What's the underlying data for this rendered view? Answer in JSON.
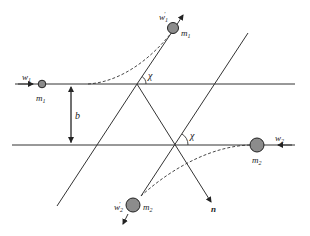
{
  "diagram": {
    "colors": {
      "line": "#333333",
      "ball_fill": "#8c8c8c",
      "ball_stroke": "#222222",
      "dashed": "#333333"
    },
    "labels": {
      "w1": "w",
      "w1_sub": "1",
      "m1_initial": "m",
      "m1_initial_sub": "1",
      "w1_prime": "w",
      "w1_prime_sub": "1",
      "w1_prime_mark": "'",
      "m1_final": "m",
      "m1_final_sub": "1",
      "b": "b",
      "chi_top": "χ",
      "chi_bottom": "χ",
      "w2": "w",
      "w2_sub": "2",
      "m2_initial": "m",
      "m2_initial_sub": "2",
      "w2_prime": "w",
      "w2_prime_sub": "2",
      "w2_prime_mark": "'",
      "m2_final": "m",
      "m2_final_sub": "2",
      "n": "n"
    },
    "elements": [
      "incoming particle m1 with velocity w1 on upper line",
      "outgoing particle m1 with velocity w1'",
      "incoming particle m2 with velocity w2 on lower line",
      "outgoing particle m2 with velocity w2'",
      "impact parameter b between parallel lines",
      "scattering angle χ at both intersections",
      "unit vector n along apse line"
    ]
  }
}
